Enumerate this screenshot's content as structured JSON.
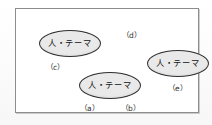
{
  "figure": {
    "type": "diagram",
    "background_color": "#ffffff",
    "frame": {
      "border_color": "#8d8d8d",
      "fill_color": "#ffffff"
    },
    "ellipse_style": {
      "fill_color": "#e9e9e9",
      "border_color": "#2f2f2f"
    },
    "node_text": "人・テーマ",
    "nodes": [
      {
        "id": "c",
        "text": "人・テーマ",
        "position": "top-left"
      },
      {
        "id": "a",
        "text": "人・テーマ",
        "position": "bottom-center"
      },
      {
        "id": "e",
        "text": "人・テーマ",
        "position": "middle-right"
      }
    ],
    "annotations": [
      {
        "id": "c",
        "label": "（c）",
        "position": "left-middle"
      },
      {
        "id": "d",
        "label": "（d）",
        "position": "top-center"
      },
      {
        "id": "a",
        "label": "（a）",
        "position": "bottom-left"
      },
      {
        "id": "b",
        "label": "（b）",
        "position": "bottom-center"
      },
      {
        "id": "e",
        "label": "（e）",
        "position": "right-lower"
      }
    ]
  }
}
